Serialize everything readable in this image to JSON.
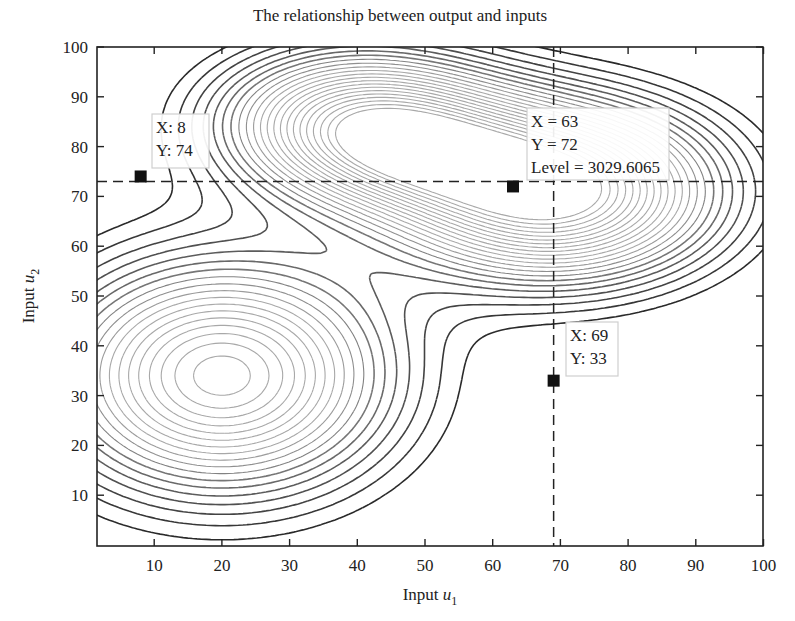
{
  "chart_data": {
    "type": "contour",
    "title": "The relationship between output and inputs",
    "xlabel": "Input u1",
    "xlabel_base": "Input ",
    "xlabel_var": "u",
    "xlabel_sub": "1",
    "ylabel": "Input u2",
    "ylabel_base": "Input ",
    "ylabel_var": "u",
    "ylabel_sub": "2",
    "xlim": [
      1.5,
      100
    ],
    "ylim": [
      0,
      100
    ],
    "x_ticks": [
      10,
      20,
      30,
      40,
      50,
      60,
      70,
      80,
      90,
      100
    ],
    "y_ticks": [
      10,
      20,
      30,
      40,
      50,
      60,
      70,
      80,
      90,
      100
    ],
    "grid": false,
    "peaks": [
      {
        "name": "lower-left hill",
        "center": [
          20,
          34
        ],
        "approx_extent": "x 1.5–43, y 10–60"
      },
      {
        "name": "upper-middle hill",
        "center": [
          40,
          84
        ],
        "approx_extent": "x 20–55, y 67–100"
      },
      {
        "name": "upper-right hill (max)",
        "center": [
          69,
          71
        ],
        "approx_extent": "x 45–95, y 53–100"
      }
    ],
    "crosshair": {
      "x": 69,
      "y": 73
    },
    "data_tips": [
      {
        "label_lines": [
          "X: 8",
          "Y: 74"
        ],
        "x": 8,
        "y": 74
      },
      {
        "label_lines": [
          "X = 63",
          "Y = 72",
          "Level = 3029.6065"
        ],
        "x": 63,
        "y": 72,
        "level": 3029.6065
      },
      {
        "label_lines": [
          "X: 69",
          "Y: 33"
        ],
        "x": 69,
        "y": 33
      }
    ]
  },
  "colors": {
    "axis": "#222222",
    "contour_dark": "#2a2a2a",
    "contour_light": "#a8a8a8",
    "marker": "#111111"
  }
}
